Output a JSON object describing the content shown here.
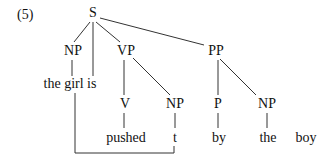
{
  "example": {
    "number": "(5)"
  },
  "tree": {
    "root": "S",
    "nodes": {
      "s": "S",
      "np_subject": "NP",
      "vp": "VP",
      "pp": "PP",
      "subject_words": "the girl is",
      "v": "V",
      "np_object": "NP",
      "p": "P",
      "np_pp": "NP",
      "verb_word": "pushed",
      "trace": "t",
      "prep_word": "by",
      "det_word": "the",
      "noun_word": "boy"
    },
    "structure": "[S [NP the girl] is [VP [V pushed] [NP t]] [PP [P by] [NP the boy]]]",
    "movement": {
      "from": "t",
      "to": "the girl",
      "type": "bracket-line"
    }
  },
  "colors": {
    "line": "#333333",
    "text": "#111111",
    "background": "#ffffff"
  }
}
